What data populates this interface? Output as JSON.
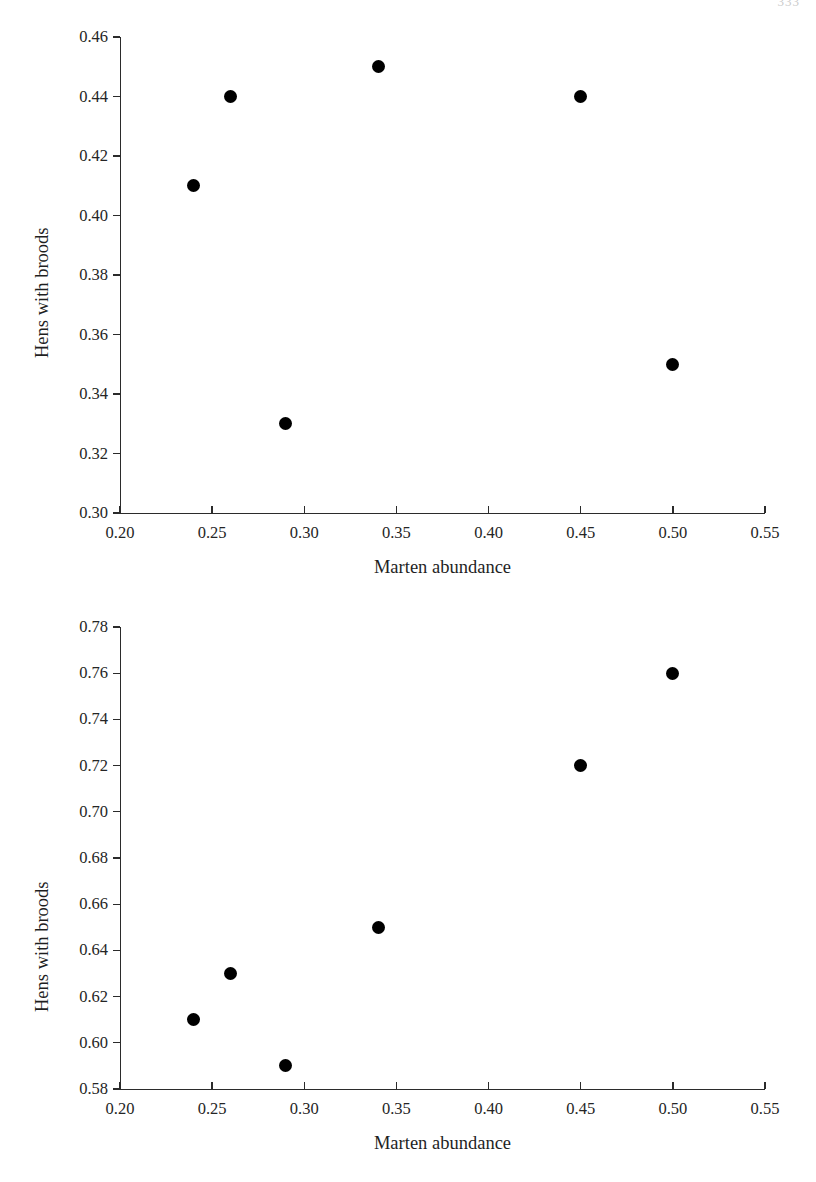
{
  "page": {
    "number": "333"
  },
  "charts": [
    {
      "id": "top",
      "chart_data": {
        "type": "scatter",
        "title": "",
        "xlabel": "Marten abundance",
        "ylabel": "Hens with broods",
        "xlim": [
          0.2,
          0.55
        ],
        "ylim": [
          0.3,
          0.46
        ],
        "xticks": [
          0.2,
          0.25,
          0.3,
          0.35,
          0.4,
          0.45,
          0.5,
          0.55
        ],
        "xticklabels": [
          "0.20",
          "0.25",
          "0.30",
          "0.35",
          "0.40",
          "0.45",
          "0.50",
          "0.55"
        ],
        "yticks": [
          0.3,
          0.32,
          0.34,
          0.36,
          0.38,
          0.4,
          0.42,
          0.44,
          0.46
        ],
        "yticklabels": [
          "0.30",
          "0.32",
          "0.34",
          "0.36",
          "0.38",
          "0.40",
          "0.42",
          "0.44",
          "0.46"
        ],
        "grid": false,
        "legend": null,
        "marker": "filled-circle",
        "marker_color": "#000000",
        "points": [
          {
            "x": 0.24,
            "y": 0.41
          },
          {
            "x": 0.26,
            "y": 0.44
          },
          {
            "x": 0.29,
            "y": 0.33
          },
          {
            "x": 0.34,
            "y": 0.45
          },
          {
            "x": 0.45,
            "y": 0.44
          },
          {
            "x": 0.5,
            "y": 0.35
          }
        ]
      }
    },
    {
      "id": "bottom",
      "chart_data": {
        "type": "scatter",
        "title": "",
        "xlabel": "Marten abundance",
        "ylabel": "Hens with broods",
        "xlim": [
          0.2,
          0.55
        ],
        "ylim": [
          0.58,
          0.78
        ],
        "xticks": [
          0.2,
          0.25,
          0.3,
          0.35,
          0.4,
          0.45,
          0.5,
          0.55
        ],
        "xticklabels": [
          "0.20",
          "0.25",
          "0.30",
          "0.35",
          "0.40",
          "0.45",
          "0.50",
          "0.55"
        ],
        "yticks": [
          0.58,
          0.6,
          0.62,
          0.64,
          0.66,
          0.68,
          0.7,
          0.72,
          0.74,
          0.76,
          0.78
        ],
        "yticklabels": [
          "0.58",
          "0.60",
          "0.62",
          "0.64",
          "0.66",
          "0.68",
          "0.70",
          "0.72",
          "0.74",
          "0.76",
          "0.78"
        ],
        "grid": false,
        "legend": null,
        "marker": "filled-circle",
        "marker_color": "#000000",
        "points": [
          {
            "x": 0.24,
            "y": 0.61
          },
          {
            "x": 0.26,
            "y": 0.63
          },
          {
            "x": 0.29,
            "y": 0.59
          },
          {
            "x": 0.34,
            "y": 0.65
          },
          {
            "x": 0.45,
            "y": 0.72
          },
          {
            "x": 0.5,
            "y": 0.76
          }
        ]
      }
    }
  ]
}
